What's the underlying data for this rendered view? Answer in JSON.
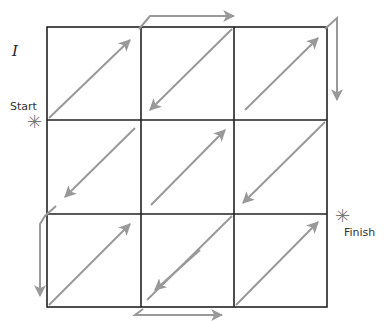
{
  "figure": {
    "label": "I",
    "start_label": "Start",
    "finish_label": "Finish",
    "start_marker": "✳",
    "finish_marker": "✳",
    "grid_color": "#222222",
    "arrow_color": "#999999",
    "grid": {
      "rows": 3,
      "cols": 3,
      "x0": 47,
      "y0": 27,
      "cell": 93.5
    }
  }
}
